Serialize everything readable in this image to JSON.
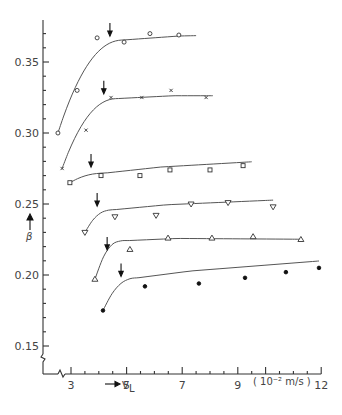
{
  "chart_data": {
    "type": "scatter",
    "title": "",
    "xlabel": "V_L",
    "xlabel_sub": "L",
    "xlabel_main": "V",
    "xunit": "( 10⁻² m/s )",
    "ylabel": "β",
    "xlim": [
      2.0,
      12.0
    ],
    "ylim": [
      0.135,
      0.38
    ],
    "x_ticks": [
      3,
      5,
      7,
      9,
      12
    ],
    "x_tick_labels": [
      "3",
      "5",
      "7",
      "9",
      "12"
    ],
    "y_ticks": [
      0.15,
      0.2,
      0.25,
      0.3,
      0.35
    ],
    "y_tick_labels": [
      "0.15",
      "0.20",
      "0.25",
      "0.30",
      "0.35"
    ],
    "axis_breaks": true,
    "grid": false,
    "series": [
      {
        "name": "series-1",
        "marker": "open-circle",
        "x": [
          2.53,
          3.22,
          3.94,
          4.91,
          5.84,
          6.88
        ],
        "y": [
          0.3,
          0.33,
          0.367,
          0.364,
          0.37,
          0.369
        ],
        "arrow_x": 4.4,
        "curve_end_x": 7.5
      },
      {
        "name": "series-2",
        "marker": "cross",
        "x": [
          2.68,
          3.54,
          4.44,
          5.55,
          6.6,
          7.86
        ],
        "y": [
          0.275,
          0.302,
          0.325,
          0.325,
          0.33,
          0.325
        ],
        "arrow_x": 4.18,
        "curve_end_x": 8.1
      },
      {
        "name": "series-3",
        "marker": "open-square",
        "x": [
          2.96,
          4.08,
          5.48,
          6.56,
          8.0,
          9.19
        ],
        "y": [
          0.265,
          0.27,
          0.27,
          0.274,
          0.274,
          0.277
        ],
        "arrow_x": 3.72,
        "curve_end_x": 9.5
      },
      {
        "name": "series-4",
        "marker": "inverted-triangle",
        "x": [
          3.5,
          4.58,
          6.06,
          7.32,
          8.65,
          10.27
        ],
        "y": [
          0.23,
          0.241,
          0.242,
          0.25,
          0.251,
          0.248
        ],
        "arrow_x": 3.94,
        "curve_end_x": 10.27
      },
      {
        "name": "series-5",
        "marker": "open-triangle",
        "x": [
          3.86,
          5.12,
          6.49,
          8.07,
          9.55,
          11.27
        ],
        "y": [
          0.197,
          0.218,
          0.226,
          0.226,
          0.227,
          0.225
        ],
        "arrow_x": 4.3,
        "curve_end_x": 11.27
      },
      {
        "name": "series-6",
        "marker": "filled-circle",
        "x": [
          4.15,
          5.66,
          7.6,
          9.26,
          10.73,
          11.92
        ],
        "y": [
          0.175,
          0.192,
          0.194,
          0.198,
          0.202,
          0.205
        ],
        "arrow_x": 4.8,
        "curve_end_x": 11.92
      }
    ]
  }
}
